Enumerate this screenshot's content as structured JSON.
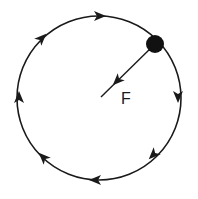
{
  "diagram": {
    "type": "uniform-circular-motion",
    "direction": "clockwise",
    "force_label": "F",
    "colors": {
      "stroke": "#1a1a1a",
      "background": "#ffffff"
    },
    "circle": {
      "cx": 99,
      "cy": 98,
      "r": 82
    },
    "object": {
      "cx": 155,
      "cy": 44,
      "r": 9
    },
    "force_vector": {
      "from": [
        155,
        44
      ],
      "to": [
        101,
        97
      ],
      "arrow_at": [
        118,
        80
      ]
    },
    "direction_arrows": [
      {
        "position": "top",
        "x": 100,
        "y": 16,
        "angle": 0
      },
      {
        "position": "upper-left",
        "x": 42,
        "y": 38,
        "angle": -45
      },
      {
        "position": "left",
        "x": 19,
        "y": 97,
        "angle": -90
      },
      {
        "position": "lower-left",
        "x": 43,
        "y": 157,
        "angle": -135
      },
      {
        "position": "bottom",
        "x": 95,
        "y": 180,
        "angle": 180
      },
      {
        "position": "lower-right",
        "x": 153,
        "y": 155,
        "angle": 135
      },
      {
        "position": "right",
        "x": 178,
        "y": 97,
        "angle": 90
      }
    ]
  }
}
